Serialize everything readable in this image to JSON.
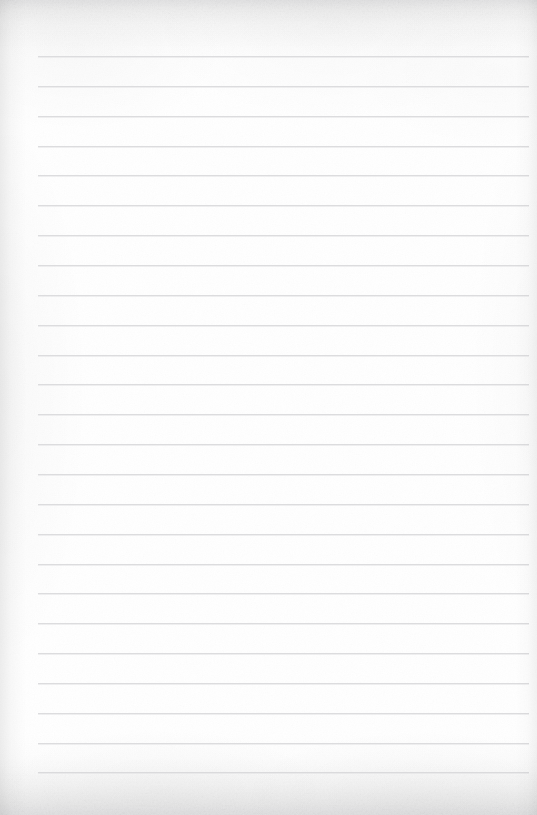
{
  "document": {
    "type": "scanned-lined-notebook-page",
    "title": "Blank lined notebook page",
    "content_text": "",
    "page_width": 537,
    "page_height": 815,
    "is_blank": true,
    "handwriting_present": false
  },
  "paper": {
    "background_color": "#ffffff",
    "paper_tone_color": "#fdfdfd",
    "edge_shadow_color": "#f0f0f1",
    "texture": "fine paper grain with soft scanner edge vignette"
  },
  "ruling": {
    "line_color": "#dcdcde",
    "line_thickness_px": 1,
    "line_spacing_px": 29.83,
    "first_line_y": 56,
    "last_line_y": 772,
    "line_start_x": 38,
    "line_end_x": 529,
    "line_count": 25,
    "margin_rule_present": false,
    "lines": [
      {
        "index": 1,
        "y": 56,
        "text": ""
      },
      {
        "index": 2,
        "y": 86,
        "text": ""
      },
      {
        "index": 3,
        "y": 116,
        "text": ""
      },
      {
        "index": 4,
        "y": 146,
        "text": ""
      },
      {
        "index": 5,
        "y": 175,
        "text": ""
      },
      {
        "index": 6,
        "y": 205,
        "text": ""
      },
      {
        "index": 7,
        "y": 235,
        "text": ""
      },
      {
        "index": 8,
        "y": 265,
        "text": ""
      },
      {
        "index": 9,
        "y": 295,
        "text": ""
      },
      {
        "index": 10,
        "y": 325,
        "text": ""
      },
      {
        "index": 11,
        "y": 355,
        "text": ""
      },
      {
        "index": 12,
        "y": 384,
        "text": ""
      },
      {
        "index": 13,
        "y": 414,
        "text": ""
      },
      {
        "index": 14,
        "y": 444,
        "text": ""
      },
      {
        "index": 15,
        "y": 474,
        "text": ""
      },
      {
        "index": 16,
        "y": 504,
        "text": ""
      },
      {
        "index": 17,
        "y": 534,
        "text": ""
      },
      {
        "index": 18,
        "y": 564,
        "text": ""
      },
      {
        "index": 19,
        "y": 593,
        "text": ""
      },
      {
        "index": 20,
        "y": 623,
        "text": ""
      },
      {
        "index": 21,
        "y": 653,
        "text": ""
      },
      {
        "index": 22,
        "y": 683,
        "text": ""
      },
      {
        "index": 23,
        "y": 713,
        "text": ""
      },
      {
        "index": 24,
        "y": 743,
        "text": ""
      },
      {
        "index": 25,
        "y": 772,
        "text": ""
      }
    ]
  }
}
